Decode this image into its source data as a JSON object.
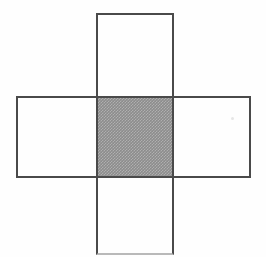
{
  "figure": {
    "kind": "geometric-diagram",
    "description": "Cross-shaped net formed by a tall vertical rectangle overlapping a wide horizontal rectangle, with the square overlap region shaded gray.",
    "canvas": {
      "width": 266,
      "height": 257,
      "background_color": "#fefefe"
    },
    "stroke": {
      "color": "#4a4a4a",
      "width_px": 2,
      "faint_color": "#b9b9b9"
    },
    "shapes": [
      {
        "name": "vertical-rectangle",
        "x": 96,
        "y": 13,
        "width": 78,
        "height": 242,
        "fill": "none",
        "stroke_color": "#4a4a4a"
      },
      {
        "name": "horizontal-rectangle",
        "x": 16,
        "y": 96,
        "width": 235,
        "height": 82,
        "fill": "none",
        "stroke_color": "#4a4a4a"
      },
      {
        "name": "center-square",
        "x": 96,
        "y": 96,
        "width": 78,
        "height": 82,
        "fill": "#8c8c8c",
        "fill_style": "halftone-dither",
        "stroke_color": "none"
      }
    ],
    "artifacts": [
      {
        "name": "scan-speck",
        "x": 231,
        "y": 117,
        "size": 3,
        "color": "#e6e6e6"
      }
    ]
  }
}
